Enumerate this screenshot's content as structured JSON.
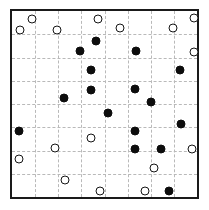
{
  "chart_data": {
    "type": "scatter",
    "title": "",
    "subtitle": "",
    "xlabel": "",
    "ylabel": "",
    "xlim": [
      0,
      8
    ],
    "ylim": [
      0,
      8
    ],
    "grid": true,
    "grid_style": "dashed",
    "grid_color": "#b9b9b9",
    "border_color": "#1a1a1a",
    "legend": "none",
    "xticks": [
      0,
      1,
      2,
      3,
      4,
      5,
      6,
      7,
      8
    ],
    "yticks": [
      0,
      1,
      2,
      3,
      4,
      5,
      6,
      7,
      8
    ],
    "xticklabels": [],
    "yticklabels": [],
    "annotations": [],
    "marker_size_px": 9,
    "series": [
      {
        "name": "open",
        "marker": "o",
        "fill": "#ffffff",
        "edge": "#151515",
        "points": [
          {
            "x": 0.85,
            "y": 7.65
          },
          {
            "x": 3.7,
            "y": 7.65
          },
          {
            "x": 4.65,
            "y": 7.25
          },
          {
            "x": 6.95,
            "y": 7.25
          },
          {
            "x": 7.85,
            "y": 7.7
          },
          {
            "x": 0.35,
            "y": 7.2
          },
          {
            "x": 1.95,
            "y": 7.2
          },
          {
            "x": 7.85,
            "y": 6.25
          },
          {
            "x": 3.4,
            "y": 2.55
          },
          {
            "x": 1.85,
            "y": 2.1
          },
          {
            "x": 0.3,
            "y": 1.65
          },
          {
            "x": 7.8,
            "y": 2.05
          },
          {
            "x": 6.15,
            "y": 1.25
          },
          {
            "x": 2.3,
            "y": 0.75
          },
          {
            "x": 3.8,
            "y": 0.25
          },
          {
            "x": 5.75,
            "y": 0.25
          }
        ]
      },
      {
        "name": "filled",
        "marker": "o",
        "fill": "#0d0d0d",
        "edge": "#0d0d0d",
        "points": [
          {
            "x": 3.65,
            "y": 6.7
          },
          {
            "x": 2.95,
            "y": 6.3
          },
          {
            "x": 5.35,
            "y": 6.3
          },
          {
            "x": 3.4,
            "y": 5.45
          },
          {
            "x": 7.25,
            "y": 5.45
          },
          {
            "x": 3.4,
            "y": 4.6
          },
          {
            "x": 5.3,
            "y": 4.65
          },
          {
            "x": 2.25,
            "y": 4.25
          },
          {
            "x": 6.0,
            "y": 4.1
          },
          {
            "x": 4.15,
            "y": 3.6
          },
          {
            "x": 7.3,
            "y": 3.15
          },
          {
            "x": 0.3,
            "y": 2.85
          },
          {
            "x": 5.3,
            "y": 2.85
          },
          {
            "x": 5.3,
            "y": 2.05
          },
          {
            "x": 6.45,
            "y": 2.05
          },
          {
            "x": 6.8,
            "y": 0.25
          }
        ]
      }
    ]
  }
}
